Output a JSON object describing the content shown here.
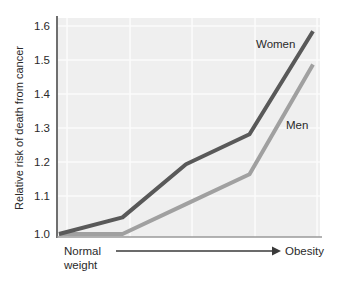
{
  "chart_data": {
    "type": "line",
    "title": "",
    "subtitle": "",
    "xlabel": "",
    "ylabel": "Relative risk of death from cancer",
    "x_axis_start_label": "Normal weight",
    "x_axis_start_label_line1": "Normal",
    "x_axis_start_label_line2": "weight",
    "x_axis_end_label": "Obesity",
    "x_axis_style": "arrow from Normal weight to Obesity (no numeric ticks)",
    "x": [
      0,
      1,
      2,
      3,
      4
    ],
    "ylim": [
      1.0,
      1.65
    ],
    "yticks": [
      "1.0",
      "1.1",
      "1.2",
      "1.3",
      "1.4",
      "1.5",
      "1.6"
    ],
    "ytick_values": [
      1.0,
      1.1,
      1.2,
      1.3,
      1.4,
      1.5,
      1.6
    ],
    "grid": "light white gridlines on gray panel",
    "legend_position": "inline labels next to lines",
    "series": [
      {
        "name": "Women",
        "color": "#595959",
        "values": [
          1.0,
          1.05,
          1.21,
          1.3,
          1.61
        ]
      },
      {
        "name": "Men",
        "color": "#a0a0a0",
        "values": [
          1.0,
          1.0,
          1.09,
          1.18,
          1.51
        ]
      }
    ],
    "annotations": [
      {
        "text": "Women",
        "series": "Women"
      },
      {
        "text": "Men",
        "series": "Men"
      }
    ],
    "colors": {
      "panel_background": "#efefef",
      "gridline": "#fafafa",
      "axis": "#808080",
      "text": "#2a2a2a",
      "women_line": "#595959",
      "men_line": "#a0a0a0"
    }
  }
}
